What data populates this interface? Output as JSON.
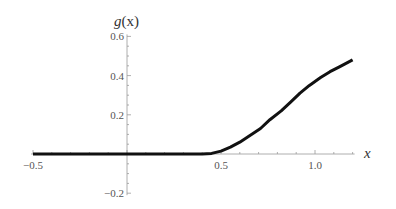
{
  "chart_data": {
    "type": "line",
    "title": "",
    "xlabel": "x",
    "ylabel": "g(x)",
    "xlim": [
      -0.5,
      1.2
    ],
    "ylim": [
      -0.2,
      0.6
    ],
    "grid": false,
    "legend": null,
    "x_ticks": [
      -0.5,
      0.5,
      1.0
    ],
    "x_tick_labels": [
      "−0.5",
      "0.5",
      "1.0"
    ],
    "y_ticks": [
      -0.2,
      0.2,
      0.4,
      0.6
    ],
    "y_tick_labels": [
      "−0.2",
      "0.2",
      "0.4",
      "0.6"
    ],
    "series": [
      {
        "name": "g(x)",
        "color": "#111111",
        "x": [
          -0.5,
          -0.25,
          0.0,
          0.25,
          0.4,
          0.45,
          0.5,
          0.55,
          0.6,
          0.65,
          0.71,
          0.76,
          0.82,
          0.87,
          0.92,
          0.97,
          1.03,
          1.08,
          1.13,
          1.2
        ],
        "y": [
          0.0,
          0.0,
          0.0,
          0.0,
          0.0,
          0.003,
          0.015,
          0.035,
          0.06,
          0.092,
          0.13,
          0.175,
          0.22,
          0.265,
          0.31,
          0.35,
          0.39,
          0.42,
          0.445,
          0.48
        ]
      }
    ]
  },
  "labels": {
    "y_axis_name": "g",
    "y_axis_arg": "(x)",
    "x_axis_name": "x"
  }
}
